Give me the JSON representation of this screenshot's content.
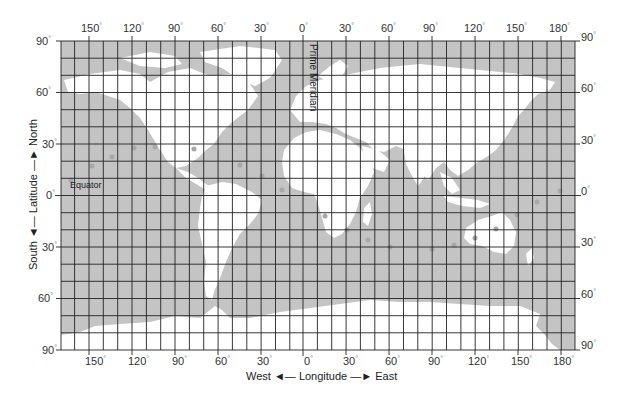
{
  "map": {
    "type": "world grid map (latitude/longitude)",
    "colors": {
      "ocean": "#c4c4c4",
      "land": "#ffffff",
      "grid": "#222222",
      "marker": "#a8a8a8"
    },
    "frame": {
      "left": 61,
      "right": 575,
      "top": 41,
      "bottom": 350
    },
    "grid_spacing_deg": 10
  },
  "top_axis": {
    "labels": [
      "150",
      "120",
      "90",
      "60",
      "30",
      "0",
      "30",
      "60",
      "90",
      "120",
      "150",
      "180"
    ]
  },
  "bottom_axis": {
    "labels": [
      "150",
      "120",
      "90",
      "60",
      "30",
      "0",
      "30",
      "60",
      "90",
      "120",
      "150",
      "180"
    ],
    "title_west": "West",
    "title_center": "Longitude",
    "title_east": "East"
  },
  "left_axis": {
    "labels": [
      "90",
      "60",
      "30",
      "0",
      "30",
      "60",
      "90"
    ],
    "title_south": "South",
    "title_center": "Latitude",
    "title_north": "North"
  },
  "right_axis": {
    "labels": [
      "90",
      "60",
      "30",
      "0",
      "30",
      "60",
      "90"
    ]
  },
  "annotations": {
    "prime_meridian": "Prime Meridian",
    "equator": "Equator"
  },
  "degree_symbol": "°",
  "arrow_left": "◄—",
  "arrow_right": "—►"
}
